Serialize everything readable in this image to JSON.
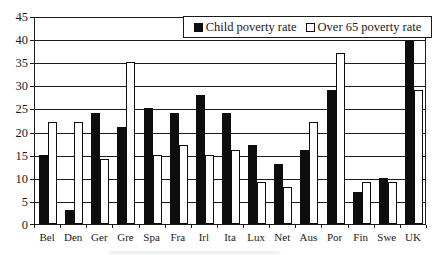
{
  "chart_data": {
    "type": "bar",
    "title": "",
    "xlabel": "",
    "ylabel": "",
    "categories": [
      "Bel",
      "Den",
      "Ger",
      "Gre",
      "Spa",
      "Fra",
      "Irl",
      "Ita",
      "Lux",
      "Net",
      "Aus",
      "Por",
      "Fin",
      "Swe",
      "UK"
    ],
    "series": [
      {
        "name": "Child poverty rate",
        "swatch": "filled-black-square",
        "color": "#0d0d0d",
        "values": [
          15,
          3,
          24,
          21,
          25,
          24,
          28,
          24,
          17,
          13,
          16,
          29,
          7,
          10,
          39.5
        ]
      },
      {
        "name": "Over 65 poverty rate",
        "swatch": "open-white-square",
        "color": "#ffffff",
        "values": [
          22,
          22,
          14,
          35,
          15,
          17,
          15,
          16,
          9,
          8,
          22,
          37,
          9,
          9,
          29
        ]
      }
    ],
    "ylim": [
      0,
      45
    ],
    "y_ticks": [
      0,
      5,
      10,
      15,
      20,
      25,
      30,
      35,
      40,
      45
    ],
    "grid": "horizontal",
    "legend_position": "top-inside-right",
    "plot_border": true
  },
  "colors": {
    "line": "#1a1a1a",
    "bar_series1": "#0d0d0d",
    "bar_series2": "#ffffff",
    "background": "#ffffff"
  }
}
